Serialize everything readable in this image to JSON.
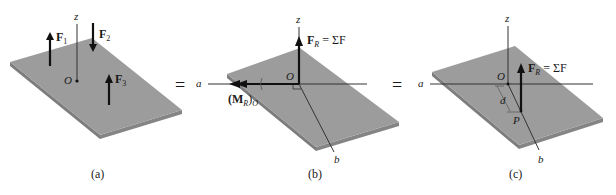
{
  "figure": {
    "panels": [
      {
        "id": "a",
        "caption": "(a)",
        "axis_z": "z",
        "origin": "O",
        "forces": [
          {
            "label": "F",
            "sub": "1",
            "direction": "up"
          },
          {
            "label": "F",
            "sub": "2",
            "direction": "down"
          },
          {
            "label": "F",
            "sub": "3",
            "direction": "up"
          }
        ]
      },
      {
        "id": "b",
        "caption": "(b)",
        "axis_z": "z",
        "axis_a": "a",
        "axis_b": "b",
        "origin": "O",
        "resultant_force": {
          "label": "F",
          "sub": "R",
          "eq": " = ΣF"
        },
        "resultant_moment": {
          "open": "(M",
          "sub": "R",
          "close": ")",
          "sub2": "O"
        }
      },
      {
        "id": "c",
        "caption": "(c)",
        "axis_z": "z",
        "axis_a": "a",
        "axis_b": "b",
        "origin": "O",
        "point": "P",
        "distance": "d",
        "resultant_force": {
          "label": "F",
          "sub": "R",
          "eq": " = ΣF"
        }
      }
    ],
    "equals": [
      "=",
      "="
    ],
    "colors": {
      "plate_top": "#9a9a9a",
      "plate_edge": "#7a7a7a",
      "ink": "#111111",
      "axis": "#333333"
    }
  }
}
